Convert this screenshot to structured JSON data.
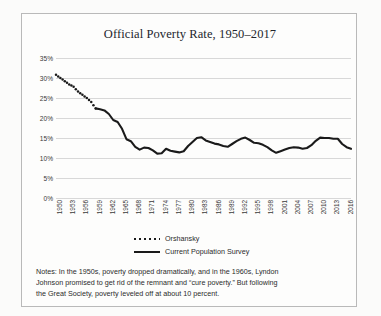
{
  "chart_data": {
    "type": "line",
    "title": "Official Poverty Rate, 1950–2017",
    "xlabel": "",
    "ylabel": "",
    "ylim": [
      0,
      35
    ],
    "ytick_labels": [
      "35%",
      "30%",
      "25%",
      "20%",
      "15%",
      "10%",
      "5%",
      "0%"
    ],
    "ytick_values": [
      35,
      30,
      25,
      20,
      15,
      10,
      5,
      0
    ],
    "xlim": [
      1950,
      2017
    ],
    "xtick_labels": [
      "1950",
      "1953",
      "1956",
      "1959",
      "1962",
      "1965",
      "1968",
      "1971",
      "1974",
      "1977",
      "1980",
      "1983",
      "1986",
      "1989",
      "1992",
      "1995",
      "1998",
      "2001",
      "2004",
      "2007",
      "2010",
      "2013",
      "2016"
    ],
    "grid": true,
    "legend_position": "bottom-center",
    "series": [
      {
        "name": "Orshansky",
        "style": "dotted",
        "color": "#1a1a1a",
        "x": [
          1950,
          1951,
          1952,
          1953,
          1954,
          1955,
          1956,
          1957,
          1958,
          1959
        ],
        "values": [
          30.8,
          30.0,
          29.2,
          28.4,
          27.8,
          26.6,
          25.8,
          25.0,
          24.0,
          22.4
        ]
      },
      {
        "name": "Current Population Survey",
        "style": "solid",
        "color": "#1a1a1a",
        "x": [
          1959,
          1960,
          1961,
          1962,
          1963,
          1964,
          1965,
          1966,
          1967,
          1968,
          1969,
          1970,
          1971,
          1972,
          1973,
          1974,
          1975,
          1976,
          1977,
          1978,
          1979,
          1980,
          1981,
          1982,
          1983,
          1984,
          1985,
          1986,
          1987,
          1988,
          1989,
          1990,
          1991,
          1992,
          1993,
          1994,
          1995,
          1996,
          1997,
          1998,
          1999,
          2000,
          2001,
          2002,
          2003,
          2004,
          2005,
          2006,
          2007,
          2008,
          2009,
          2010,
          2011,
          2012,
          2013,
          2014,
          2015,
          2016,
          2017
        ],
        "values": [
          22.4,
          22.2,
          21.9,
          21.0,
          19.5,
          19.0,
          17.3,
          14.7,
          14.2,
          12.8,
          12.1,
          12.6,
          12.5,
          11.9,
          11.1,
          11.2,
          12.3,
          11.8,
          11.6,
          11.4,
          11.7,
          13.0,
          14.0,
          15.0,
          15.2,
          14.4,
          14.0,
          13.6,
          13.4,
          13.0,
          12.8,
          13.5,
          14.2,
          14.8,
          15.1,
          14.5,
          13.8,
          13.7,
          13.3,
          12.7,
          11.9,
          11.3,
          11.7,
          12.1,
          12.5,
          12.7,
          12.6,
          12.3,
          12.5,
          13.2,
          14.3,
          15.1,
          15.0,
          15.0,
          14.8,
          14.8,
          13.5,
          12.7,
          12.3
        ]
      }
    ]
  },
  "notes": {
    "line1": "Notes: In the 1950s, poverty dropped dramatically, and in the 1960s, Lyndon",
    "line2": "Johnson promised to get rid of the remnant and “cure poverty.”  But following",
    "line3": "the Great Society, poverty leveled off at about 10 percent."
  }
}
